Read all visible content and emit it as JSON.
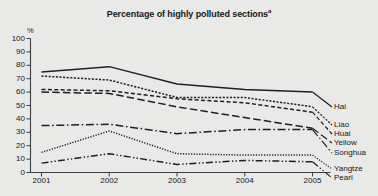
{
  "chart_data": {
    "type": "line",
    "title": "Percentage of highly polluted sections",
    "title_footnote_marker": "a",
    "xlabel": "",
    "ylabel": "%",
    "y_unit": "%",
    "categories": [
      "2001",
      "2002",
      "2003",
      "2004",
      "2005"
    ],
    "x": [
      2001,
      2002,
      2003,
      2004,
      2005
    ],
    "ylim": [
      0,
      100
    ],
    "yticks": [
      0,
      10,
      20,
      30,
      40,
      50,
      60,
      70,
      80,
      90,
      100
    ],
    "grid": false,
    "legend_position": "right",
    "series": [
      {
        "name": "Hai",
        "values": [
          75,
          79,
          66,
          62,
          60
        ],
        "style": "solid",
        "color": "#1d2124"
      },
      {
        "name": "Liao",
        "values": [
          72,
          69,
          56,
          56,
          49
        ],
        "style": "dotted-fine",
        "color": "#1d2124"
      },
      {
        "name": "Huai",
        "values": [
          62,
          61,
          55,
          52,
          45
        ],
        "style": "dashed-short",
        "color": "#1d2124"
      },
      {
        "name": "Yellow",
        "values": [
          60,
          59,
          49,
          41,
          33
        ],
        "style": "dashed-long",
        "color": "#1d2124"
      },
      {
        "name": "Songhua",
        "values": [
          35,
          36,
          29,
          32,
          32
        ],
        "style": "dash-dot",
        "color": "#1d2124"
      },
      {
        "name": "Yangtze",
        "values": [
          15,
          31,
          14,
          13,
          13
        ],
        "style": "dotted",
        "color": "#1d2124"
      },
      {
        "name": "Pearl",
        "values": [
          7,
          14,
          6,
          9,
          8
        ],
        "style": "dash-dot-dot",
        "color": "#1d2124"
      }
    ]
  },
  "chart": {
    "title": "Percentage of highly polluted sections",
    "title_marker": "a",
    "y_unit": "%"
  },
  "legend": {
    "items": [
      {
        "label": "Hai"
      },
      {
        "label": "Liao"
      },
      {
        "label": "Huai"
      },
      {
        "label": "Yellow"
      },
      {
        "label": "Songhua"
      },
      {
        "label": "Yangtze"
      },
      {
        "label": "Pearl"
      }
    ]
  }
}
